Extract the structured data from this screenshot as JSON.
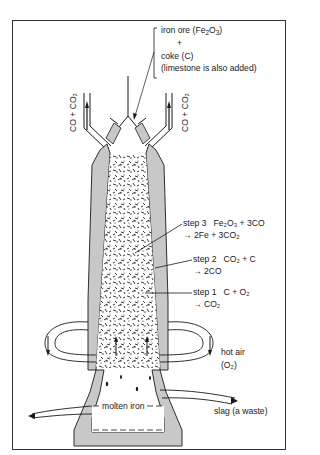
{
  "diagram": {
    "inputs": {
      "line1": "iron ore (Fe",
      "line1_sub": "2",
      "line1_mid": "O",
      "line1_sub2": "3",
      "line1_end": ")",
      "plus": "+",
      "line2": "coke (C)",
      "line3": "(limestone is also added)"
    },
    "exhaust_left": "CO + CO₂",
    "exhaust_right": "CO + CO₂",
    "steps": [
      {
        "label": "step 3",
        "reaction_line1": "Fe₂O₃ + 3CO",
        "reaction_line2": "→ 2Fe + 3CO₂"
      },
      {
        "label": "step 2",
        "reaction_line1": "CO₂ + C",
        "reaction_line2": "→ 2CO"
      },
      {
        "label": "step 1",
        "reaction_line1": "C + O₂",
        "reaction_line2": "→ CO₂"
      }
    ],
    "hot_air_line1": "hot air",
    "hot_air_line2": "(O₂)",
    "molten_iron": "molten iron",
    "slag": "slag (a waste)",
    "colors": {
      "wall": "#c8c8c8",
      "line": "#1a1a1a",
      "background": "#ffffff"
    }
  }
}
